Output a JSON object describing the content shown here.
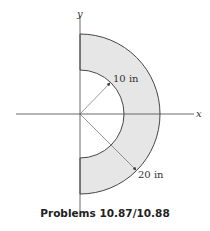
{
  "figure": {
    "caption": "Problems 10.87/10.88",
    "axes": {
      "x_label": "x",
      "y_label": "y"
    },
    "dimensions": [
      {
        "label": "10 in",
        "meaning": "inner radius"
      },
      {
        "label": "20 in",
        "meaning": "outer radius"
      }
    ],
    "shape": "half annulus (right half), shaded",
    "colors": {
      "fill": "#e6e6e6",
      "stroke": "#333333"
    }
  }
}
